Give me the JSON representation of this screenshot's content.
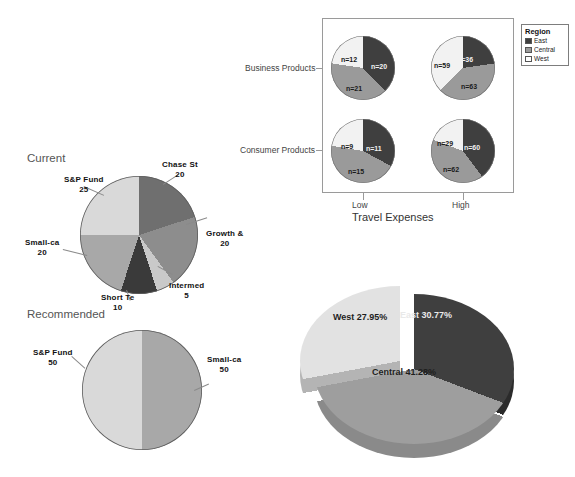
{
  "colors": {
    "east_dark": "#3f3f3f",
    "central_gray": "#9a9a9a",
    "west_light": "#f2f2f2",
    "chase_gray": "#6f6f6f",
    "growth_gray": "#8d8d8d",
    "intermed_light": "#c9c9c9",
    "short_dark": "#3a3a3a",
    "small_mid": "#a8a8a8",
    "sp_light": "#d9d9d9",
    "frame": "#9a9a9a",
    "text": "#111111"
  },
  "panel_chart": {
    "type": "pie",
    "title": "",
    "xlabel": "Travel Expenses",
    "ylabel": "",
    "x_ticks": [
      "Low",
      "High"
    ],
    "y_ticks": [
      "Business Products",
      "Consumer Products"
    ],
    "legend": {
      "title": "Region",
      "position": "right",
      "entries": [
        {
          "label": "East",
          "color": "#3f3f3f"
        },
        {
          "label": "Central",
          "color": "#9a9a9a"
        },
        {
          "label": "West",
          "color": "#f2f2f2"
        }
      ]
    },
    "cells": [
      {
        "row": "Business Products",
        "col": "Low",
        "slices": [
          {
            "name": "East",
            "label": "n=20",
            "value": 20
          },
          {
            "name": "Central",
            "label": "n=21",
            "value": 21
          },
          {
            "name": "West",
            "label": "n=12",
            "value": 12
          }
        ]
      },
      {
        "row": "Business Products",
        "col": "High",
        "slices": [
          {
            "name": "East",
            "label": "n=36",
            "value": 36
          },
          {
            "name": "Central",
            "label": "n=63",
            "value": 63
          },
          {
            "name": "West",
            "label": "n=59",
            "value": 59
          }
        ]
      },
      {
        "row": "Consumer Products",
        "col": "Low",
        "slices": [
          {
            "name": "East",
            "label": "n=11",
            "value": 11
          },
          {
            "name": "Central",
            "label": "n=15",
            "value": 15
          },
          {
            "name": "West",
            "label": "n=9",
            "value": 9
          }
        ]
      },
      {
        "row": "Consumer Products",
        "col": "High",
        "slices": [
          {
            "name": "East",
            "label": "n=60",
            "value": 60
          },
          {
            "name": "Central",
            "label": "n=62",
            "value": 62
          },
          {
            "name": "West",
            "label": "n=29",
            "value": 29
          }
        ]
      }
    ]
  },
  "current_chart": {
    "type": "pie",
    "title": "Current",
    "categories": [
      "Chase St",
      "Growth &",
      "Intermed",
      "Short Te",
      "Small-ca",
      "S&P Fund"
    ],
    "values": [
      20,
      20,
      5,
      10,
      20,
      25
    ],
    "value_labels": [
      "20",
      "20",
      "5",
      "10",
      "20",
      "25"
    ]
  },
  "recommended_chart": {
    "type": "pie",
    "title": "Recommended",
    "categories": [
      "Small-ca",
      "S&P Fund"
    ],
    "values": [
      50,
      50
    ],
    "value_labels": [
      "50",
      "50"
    ]
  },
  "pie3d_chart": {
    "type": "pie",
    "title": "",
    "categories": [
      "East",
      "Central",
      "West"
    ],
    "values": [
      30.77,
      41.28,
      27.95
    ],
    "value_labels": [
      "East  30.77%",
      "Central  41.28%",
      "West  27.95%"
    ],
    "exploded": [
      "West"
    ]
  }
}
